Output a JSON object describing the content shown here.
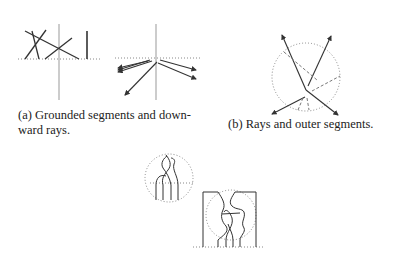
{
  "figure": {
    "subfigures": [
      {
        "id": "a",
        "label": "(a)",
        "caption": "(a) Grounded segments and down-",
        "caption_line2": "ward rays."
      },
      {
        "id": "b",
        "label": "(b)",
        "caption": "(b) Rays and outer segments."
      },
      {
        "id": "c",
        "label": "",
        "caption": ""
      }
    ],
    "colors": {
      "stroke": "#333333",
      "axis": "#999999",
      "dotted": "#888888",
      "dashed": "#777777"
    }
  }
}
